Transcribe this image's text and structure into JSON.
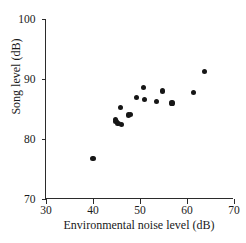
{
  "chart_data": {
    "type": "scatter",
    "title": "",
    "xlabel": "Environmental noise level (dB)",
    "ylabel": "Song level (dB)",
    "xlim": [
      30,
      70
    ],
    "ylim": [
      70,
      100
    ],
    "xticks": [
      30,
      40,
      50,
      60,
      70
    ],
    "yticks": [
      70,
      80,
      90,
      100
    ],
    "xtick_labels": [
      "30",
      "40",
      "50",
      "60",
      "70"
    ],
    "ytick_labels": [
      "70",
      "80",
      "90",
      "100"
    ],
    "grid": false,
    "legend": null,
    "marker": {
      "shape": "circle",
      "color": "#161616",
      "size_px": 5.2
    },
    "series": [
      {
        "name": "Song level vs environmental noise",
        "points": [
          {
            "x": 40.0,
            "y": 76.7
          },
          {
            "x": 44.8,
            "y": 83.3
          },
          {
            "x": 44.9,
            "y": 82.9
          },
          {
            "x": 45.3,
            "y": 82.6
          },
          {
            "x": 45.8,
            "y": 85.2
          },
          {
            "x": 46.0,
            "y": 82.4
          },
          {
            "x": 47.5,
            "y": 84.0
          },
          {
            "x": 48.0,
            "y": 84.1
          },
          {
            "x": 49.3,
            "y": 86.9
          },
          {
            "x": 50.8,
            "y": 88.6
          },
          {
            "x": 51.0,
            "y": 86.6
          },
          {
            "x": 53.5,
            "y": 86.3
          },
          {
            "x": 54.8,
            "y": 88.0
          },
          {
            "x": 56.8,
            "y": 86.0
          },
          {
            "x": 61.3,
            "y": 87.8
          },
          {
            "x": 63.8,
            "y": 91.3
          }
        ]
      }
    ]
  }
}
